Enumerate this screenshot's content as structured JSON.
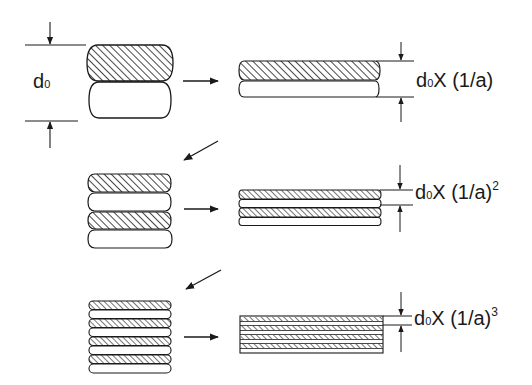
{
  "diagram": {
    "title": "",
    "type": "process-flow",
    "colors": {
      "stroke": "#1a1a1a",
      "background": "#ffffff",
      "hatch": "#1a1a1a"
    },
    "initial_thickness_label": {
      "main": "d",
      "sub": "0"
    },
    "stages": [
      {
        "index": 1,
        "stack_layers": 2,
        "rolled_layers": 2,
        "label": {
          "prefix_main": "d",
          "prefix_sub": "0",
          "operator": "X",
          "factor": "(1/a)",
          "exponent": ""
        }
      },
      {
        "index": 2,
        "stack_layers": 4,
        "rolled_layers": 4,
        "label": {
          "prefix_main": "d",
          "prefix_sub": "0",
          "operator": "X",
          "factor": "(1/a)",
          "exponent": "2"
        }
      },
      {
        "index": 3,
        "stack_layers": 8,
        "rolled_layers": 8,
        "label": {
          "prefix_main": "d",
          "prefix_sub": "0",
          "operator": "X",
          "factor": "(1/a)",
          "exponent": "3"
        }
      }
    ],
    "connectors": [
      {
        "from": "stage-1-stack",
        "to": "stage-1-rolled",
        "kind": "right-arrow"
      },
      {
        "from": "stage-1-rolled",
        "to": "stage-2-stack",
        "kind": "diagonal-arrow"
      },
      {
        "from": "stage-2-stack",
        "to": "stage-2-rolled",
        "kind": "right-arrow"
      },
      {
        "from": "stage-2-rolled",
        "to": "stage-3-stack",
        "kind": "diagonal-arrow"
      },
      {
        "from": "stage-3-stack",
        "to": "stage-3-rolled",
        "kind": "right-arrow"
      }
    ]
  }
}
